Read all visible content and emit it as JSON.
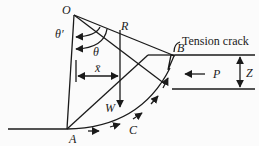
{
  "diagram": {
    "labels": {
      "O": "O",
      "R": "R",
      "theta_prime": "θ′",
      "theta": "θ",
      "x_bar": "x̄",
      "W": "W",
      "A": "A",
      "B": "B",
      "C": "C",
      "P": "P",
      "Z": "Z",
      "tension_crack": "Tension crack"
    },
    "colors": {
      "line": "#1a1a1a",
      "background": "#fbfbfb"
    }
  }
}
